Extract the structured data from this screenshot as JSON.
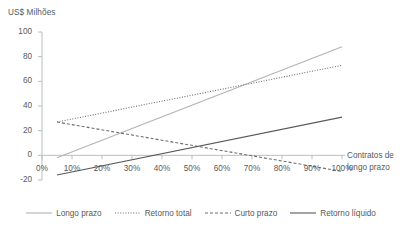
{
  "chart_data": {
    "type": "line",
    "title": "",
    "ylabel": "US$ Milhões",
    "xlabel": "Contratos de longo prazo",
    "xlabel_line1": "Contratos de",
    "xlabel_line2": "longo prazo",
    "x": [
      5,
      100
    ],
    "xlim": [
      0,
      105
    ],
    "ylim": [
      -20,
      100
    ],
    "grid": false,
    "legend_position": "bottom",
    "xticks": [
      "0%",
      "10%",
      "20%",
      "30%",
      "40%",
      "50%",
      "60%",
      "70%",
      "80%",
      "90%",
      "100%"
    ],
    "xtick_values": [
      0,
      10,
      20,
      30,
      40,
      50,
      60,
      70,
      80,
      90,
      100
    ],
    "yticks": [
      "100",
      "80",
      "60",
      "40",
      "20",
      "0",
      "-20"
    ],
    "ytick_values": [
      100,
      80,
      60,
      40,
      20,
      0,
      -20
    ],
    "series": [
      {
        "name": "Longo prazo",
        "style": "solid",
        "color": "#b3b3b3",
        "width": 1.1,
        "x": [
          5,
          100
        ],
        "values": [
          -2,
          88
        ]
      },
      {
        "name": "Retorno total",
        "style": "dotted",
        "color": "#6d6e71",
        "width": 1.1,
        "x": [
          5,
          100
        ],
        "values": [
          27,
          73
        ]
      },
      {
        "name": "Curto prazo",
        "style": "dashed",
        "color": "#6d6e71",
        "width": 1.1,
        "x": [
          5,
          100
        ],
        "values": [
          27,
          -13
        ]
      },
      {
        "name": "Retorno líquido",
        "style": "solid",
        "color": "#58595b",
        "width": 1.1,
        "x": [
          5,
          100
        ],
        "values": [
          -16,
          31
        ]
      }
    ]
  },
  "legend": {
    "items": [
      {
        "label": "Longo prazo"
      },
      {
        "label": "Retorno total"
      },
      {
        "label": "Curto prazo"
      },
      {
        "label": "Retorno líquido"
      }
    ]
  },
  "axes": {
    "y_title": "US$ Milhões",
    "x_title_line1": "Contratos de",
    "x_title_line2": "longo prazo"
  }
}
